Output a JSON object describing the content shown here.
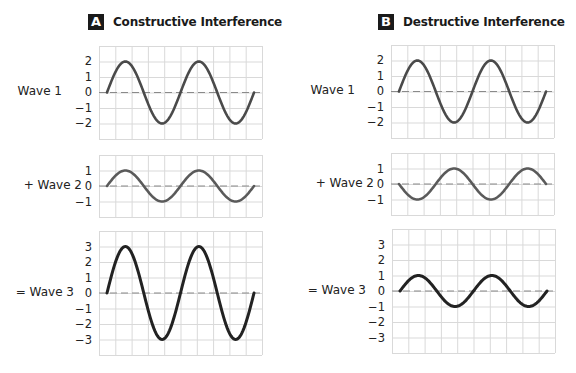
{
  "panels": [
    {
      "badge": "A",
      "title": "Constructive Interference",
      "plots": [
        {
          "label": "Wave 1",
          "amplitude": 2,
          "phase": "up",
          "y_ticks": [
            "2",
            "1",
            "0",
            "−1",
            "−2"
          ]
        },
        {
          "label": "+ Wave 2",
          "amplitude": 1,
          "phase": "up",
          "y_ticks": [
            "1",
            "0",
            "−1"
          ]
        },
        {
          "label": "= Wave 3",
          "amplitude": 3,
          "phase": "up",
          "y_ticks": [
            "3",
            "2",
            "1",
            "0",
            "−1",
            "−2",
            "−3"
          ]
        }
      ]
    },
    {
      "badge": "B",
      "title": "Destructive Interference",
      "plots": [
        {
          "label": "Wave 1",
          "amplitude": 2,
          "phase": "up",
          "y_ticks": [
            "2",
            "1",
            "0",
            "−1",
            "−2"
          ]
        },
        {
          "label": "+ Wave 2",
          "amplitude": 1,
          "phase": "down",
          "y_ticks": [
            "1",
            "0",
            "−1"
          ]
        },
        {
          "label": "= Wave 3",
          "amplitude": 1,
          "phase": "up",
          "y_ticks": [
            "3",
            "2",
            "1",
            "0",
            "−1",
            "−2",
            "−3"
          ]
        }
      ]
    }
  ],
  "chart_data": [
    {
      "type": "line",
      "title": "Constructive Interference",
      "series": [
        {
          "name": "Wave 1",
          "function": "2·sin(x)",
          "amplitude": 2,
          "periods": 2
        },
        {
          "name": "+ Wave 2",
          "function": "1·sin(x)",
          "amplitude": 1,
          "periods": 2
        },
        {
          "name": "= Wave 3",
          "function": "3·sin(x)",
          "amplitude": 3,
          "periods": 2
        }
      ],
      "ylim": {
        "Wave 1": [
          -3,
          3
        ],
        "+ Wave 2": [
          -2,
          2
        ],
        "= Wave 3": [
          -4,
          4
        ]
      },
      "grid": true,
      "zero_line": "dashed"
    },
    {
      "type": "line",
      "title": "Destructive Interference",
      "series": [
        {
          "name": "Wave 1",
          "function": "2·sin(x)",
          "amplitude": 2,
          "periods": 2
        },
        {
          "name": "+ Wave 2",
          "function": "-1·sin(x)",
          "amplitude": -1,
          "periods": 2
        },
        {
          "name": "= Wave 3",
          "function": "1·sin(x)",
          "amplitude": 1,
          "periods": 2
        }
      ],
      "ylim": {
        "Wave 1": [
          -3,
          3
        ],
        "+ Wave 2": [
          -2,
          2
        ],
        "= Wave 3": [
          -4,
          4
        ]
      },
      "grid": true,
      "zero_line": "dashed"
    }
  ],
  "colors": {
    "badge_bg": "#1a1a1a",
    "grid": "#d9d9d9",
    "curve_wave1": "#4a4a4a",
    "curve_wave2": "#5a5a5a",
    "curve_wave3": "#222222",
    "zero_line": "#8a8a8a"
  }
}
